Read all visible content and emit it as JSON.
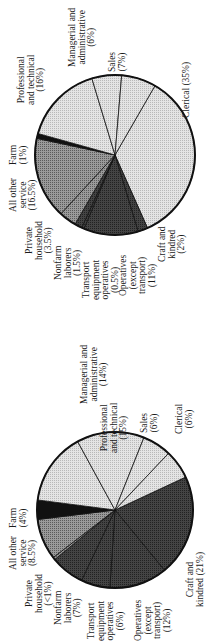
{
  "chart_data": [
    {
      "type": "pie",
      "title": "",
      "position": "top",
      "center": [
        115,
        155
      ],
      "radius": 80,
      "start_angle_deg": -60,
      "slices": [
        {
          "label": "Clerical (35%)",
          "value": 35,
          "fill": "light"
        },
        {
          "label": "Craft and kindred (2%)",
          "value": 2,
          "fill": "dark"
        },
        {
          "label": "Operatives (except transport) (11%)",
          "value": 11,
          "fill": "dark"
        },
        {
          "label": "Transport equipment operatives (0.5%)",
          "value": 0.5,
          "fill": "dark"
        },
        {
          "label": "Nonfarm laborers (1.5%)",
          "value": 1.5,
          "fill": "dark"
        },
        {
          "label": "Private household (3.5%)",
          "value": 3.5,
          "fill": "medium"
        },
        {
          "label": "All other service (16.5%)",
          "value": 16.5,
          "fill": "medium"
        },
        {
          "label": "Farm (1%)",
          "value": 1,
          "fill": "black"
        },
        {
          "label": "Professional and technical (16%)",
          "value": 16,
          "fill": "light"
        },
        {
          "label": "Managerial and administrative (6%)",
          "value": 6,
          "fill": "light"
        },
        {
          "label": "Sales (7%)",
          "value": 7,
          "fill": "light"
        }
      ]
    },
    {
      "type": "pie",
      "title": "",
      "position": "bottom",
      "center": [
        115,
        510
      ],
      "radius": 78,
      "start_angle_deg": -25,
      "slices": [
        {
          "label": "Craft and kindred (21%)",
          "value": 21,
          "fill": "dark"
        },
        {
          "label": "Operatives (except transport) (12%)",
          "value": 12,
          "fill": "dark"
        },
        {
          "label": "Transport equipment operatives (6%)",
          "value": 6,
          "fill": "dark"
        },
        {
          "label": "Nonfarm laborers (7%)",
          "value": 7,
          "fill": "dark"
        },
        {
          "label": "Private household (<1%)",
          "value": 0.5,
          "fill": "medium"
        },
        {
          "label": "All other service (8.5%)",
          "value": 8.5,
          "fill": "medium"
        },
        {
          "label": "Farm (4%)",
          "value": 4,
          "fill": "black"
        },
        {
          "label": "Professional and technical (15%)",
          "value": 15,
          "fill": "light"
        },
        {
          "label": "Managerial and administrative (14%)",
          "value": 14,
          "fill": "light"
        },
        {
          "label": "Sales (6%)",
          "value": 6,
          "fill": "light"
        },
        {
          "label": "Clerical (6%)",
          "value": 6,
          "fill": "light"
        }
      ]
    }
  ],
  "labels": {
    "top": [
      {
        "text": "Professional\nand technical\n(16%)",
        "x": 17,
        "y": 105
      },
      {
        "text": "Managerial and\nadministrative\n(6%)",
        "x": 68,
        "y": 67
      },
      {
        "text": "Sales\n(7%)",
        "x": 108,
        "y": 72
      },
      {
        "text": "Clerical (35%)",
        "x": 182,
        "y": 118
      },
      {
        "text": "Farm\n(1%)",
        "x": 9,
        "y": 165
      },
      {
        "text": "All other\nservice\n(16.5%)",
        "x": 9,
        "y": 212
      },
      {
        "text": "Private\nhousehold\n(3.5%)",
        "x": 25,
        "y": 260
      },
      {
        "text": "Nonfarm\nlaborers\n(1.5%)",
        "x": 54,
        "y": 280
      },
      {
        "text": "Transport\nequipment\noperatives\n(0.5%)",
        "x": 82,
        "y": 300
      },
      {
        "text": "Operatives\n(except\ntransport)\n(11%)",
        "x": 119,
        "y": 296
      },
      {
        "text": "Craft and\nkindred\n(2%)",
        "x": 158,
        "y": 262
      }
    ],
    "bottom": [
      {
        "text": "Professional\nand technical\n(15%)",
        "x": 100,
        "y": 453
      },
      {
        "text": "Managerial and\nadministrative\n(14%)",
        "x": 80,
        "y": 404
      },
      {
        "text": "Sales\n(6%)",
        "x": 140,
        "y": 433
      },
      {
        "text": "Clerical\n(6%)",
        "x": 175,
        "y": 434
      },
      {
        "text": "Farm\n(4%)",
        "x": 9,
        "y": 528
      },
      {
        "text": "All other\nservice\n(8.5%)",
        "x": 9,
        "y": 570
      },
      {
        "text": "Private\nhousehold\n(<1%)",
        "x": 25,
        "y": 613
      },
      {
        "text": "Nonfarm\nlaborers\n(7%)",
        "x": 54,
        "y": 625
      },
      {
        "text": "Transport\nequipment\noperatives\n(6%)",
        "x": 87,
        "y": 641
      },
      {
        "text": "Operatives\n(except\ntransport)\n(12%)",
        "x": 134,
        "y": 641
      },
      {
        "text": "Craft and\nkindred (21%)",
        "x": 186,
        "y": 607
      }
    ]
  },
  "colors": {
    "light": "#dcdcdc",
    "medium": "#8a8a8a",
    "dark": "#3a3a3a",
    "black": "#111111",
    "stroke": "#111111"
  }
}
